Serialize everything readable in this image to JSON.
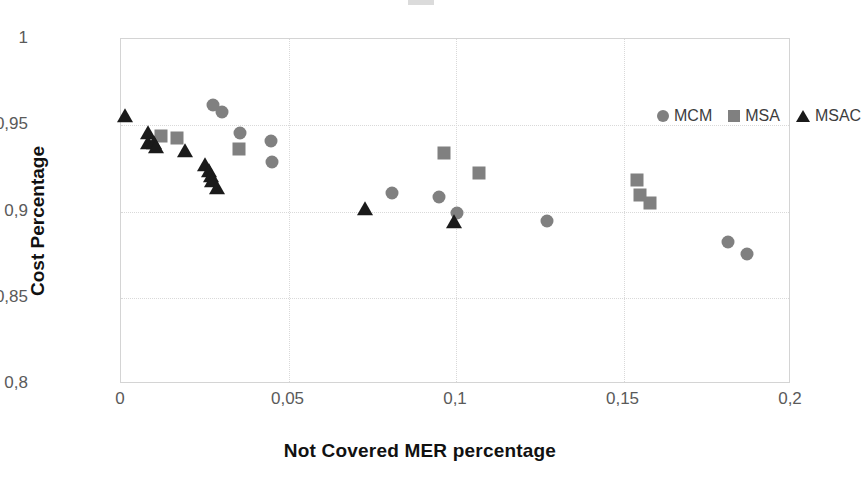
{
  "chart_data": {
    "type": "scatter",
    "title": "",
    "xlabel": "Not Covered MER percentage",
    "ylabel": "Cost Percentage",
    "xlim": [
      0,
      0.2
    ],
    "ylim": [
      0.8,
      1.0
    ],
    "xticks": [
      0,
      0.05,
      0.1,
      0.15,
      0.2
    ],
    "yticks": [
      0.8,
      0.85,
      0.9,
      0.95,
      1.0
    ],
    "xtick_labels": [
      "0",
      "0,05",
      "0,1",
      "0,15",
      "0,2"
    ],
    "ytick_labels": [
      "0,8",
      "0,85",
      "0,9",
      "0,95",
      "1"
    ],
    "decimal_separator": ",",
    "grid": true,
    "grid_style": "dotted",
    "grid_color": "#d9d9d9",
    "legend_position": "top-right-inside",
    "series": [
      {
        "name": "MCM",
        "marker": "circle",
        "color": "#808080",
        "points": [
          {
            "x": 0.0275,
            "y": 0.9615
          },
          {
            "x": 0.03,
            "y": 0.9575
          },
          {
            "x": 0.0355,
            "y": 0.9455
          },
          {
            "x": 0.0447,
            "y": 0.941
          },
          {
            "x": 0.0452,
            "y": 0.9285
          },
          {
            "x": 0.081,
            "y": 0.911
          },
          {
            "x": 0.095,
            "y": 0.9085
          },
          {
            "x": 0.1002,
            "y": 0.899
          },
          {
            "x": 0.1272,
            "y": 0.8945
          },
          {
            "x": 0.1812,
            "y": 0.8822
          },
          {
            "x": 0.187,
            "y": 0.8752
          }
        ]
      },
      {
        "name": "MSA",
        "marker": "square",
        "color": "#808080",
        "points": [
          {
            "x": 0.0118,
            "y": 0.9438
          },
          {
            "x": 0.0168,
            "y": 0.9428
          },
          {
            "x": 0.0352,
            "y": 0.9365
          },
          {
            "x": 0.0965,
            "y": 0.934
          },
          {
            "x": 0.1068,
            "y": 0.9222
          },
          {
            "x": 0.154,
            "y": 0.9182
          },
          {
            "x": 0.1548,
            "y": 0.9095
          },
          {
            "x": 0.158,
            "y": 0.9052
          }
        ]
      },
      {
        "name": "MSAC",
        "marker": "triangle",
        "color": "#1a1a1a",
        "points": [
          {
            "x": 0.0012,
            "y": 0.9555
          },
          {
            "x": 0.008,
            "y": 0.9455
          },
          {
            "x": 0.0082,
            "y": 0.94
          },
          {
            "x": 0.0098,
            "y": 0.9395
          },
          {
            "x": 0.0105,
            "y": 0.9375
          },
          {
            "x": 0.0192,
            "y": 0.9352
          },
          {
            "x": 0.0252,
            "y": 0.9268
          },
          {
            "x": 0.0262,
            "y": 0.9232
          },
          {
            "x": 0.0268,
            "y": 0.9205
          },
          {
            "x": 0.0272,
            "y": 0.9178
          },
          {
            "x": 0.0288,
            "y": 0.9138
          },
          {
            "x": 0.0728,
            "y": 0.9012
          },
          {
            "x": 0.0995,
            "y": 0.8942
          }
        ]
      }
    ]
  },
  "legend": {
    "items": [
      {
        "label": "MCM",
        "marker": "circle",
        "color": "#808080"
      },
      {
        "label": "MSA",
        "marker": "square",
        "color": "#808080"
      },
      {
        "label": "MSAC",
        "marker": "triangle",
        "color": "#1a1a1a"
      }
    ]
  }
}
